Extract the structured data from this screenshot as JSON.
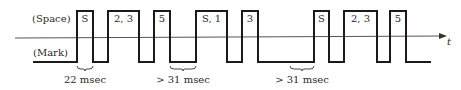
{
  "diagram": {
    "title": "",
    "level_labels": {
      "space": "(Space)",
      "mark": "(Mark)"
    },
    "axis_label": "t",
    "colors": {
      "signal": "#1a1a1a",
      "axis": "#555555",
      "text": "#2a2a2a"
    },
    "pulses": [
      {
        "label": "S",
        "x0": 77,
        "x1": 93
      },
      {
        "label": "2, 3",
        "x0": 108,
        "x1": 139
      },
      {
        "label": "5",
        "x0": 154,
        "x1": 170
      },
      {
        "label": "S, 1",
        "x0": 196,
        "x1": 227
      },
      {
        "label": "3",
        "x0": 242,
        "x1": 258
      },
      {
        "label": "S",
        "x0": 314,
        "x1": 329
      },
      {
        "label": "2, 3",
        "x0": 344,
        "x1": 377
      },
      {
        "label": "5",
        "x0": 390,
        "x1": 406
      }
    ],
    "intervals": [
      {
        "label": "22 msec",
        "x0": 77,
        "x1": 93
      },
      {
        "label": "> 31 msec",
        "x0": 170,
        "x1": 196
      },
      {
        "label": "> 31 msec",
        "x0": 290,
        "x1": 314
      }
    ]
  }
}
